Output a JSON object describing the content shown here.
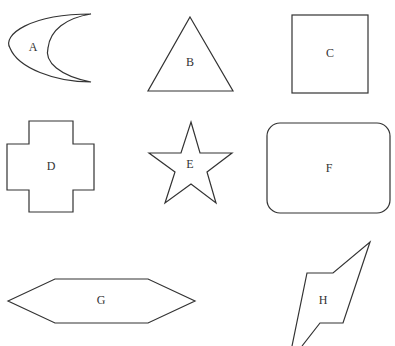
{
  "figure": {
    "shapes": [
      {
        "id": "A",
        "label": "A",
        "kind": "crescent"
      },
      {
        "id": "B",
        "label": "B",
        "kind": "triangle"
      },
      {
        "id": "C",
        "label": "C",
        "kind": "square"
      },
      {
        "id": "D",
        "label": "D",
        "kind": "cross"
      },
      {
        "id": "E",
        "label": "E",
        "kind": "star"
      },
      {
        "id": "F",
        "label": "F",
        "kind": "rounded-rectangle"
      },
      {
        "id": "G",
        "label": "G",
        "kind": "hexagon"
      },
      {
        "id": "H",
        "label": "H",
        "kind": "irregular-polygon"
      }
    ],
    "stroke_color": "#333333",
    "background_color": "#ffffff"
  }
}
